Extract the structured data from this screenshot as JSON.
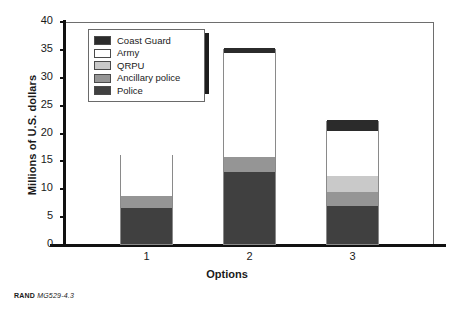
{
  "figure": {
    "footer_source": "RAND",
    "footer_number": "MG529-4.3"
  },
  "chart_data": {
    "type": "bar",
    "stacked": true,
    "title": "",
    "xlabel": "Options",
    "ylabel": "Millions of U.S. dollars",
    "categories": [
      "1",
      "2",
      "3"
    ],
    "ylim": [
      0,
      40
    ],
    "yticks": [
      0,
      5,
      10,
      15,
      20,
      25,
      30,
      35,
      40
    ],
    "ytick_labels": [
      "0",
      "5",
      "10",
      "15",
      "20",
      "25",
      "30",
      "35",
      "40"
    ],
    "grid": false,
    "legend_position": "upper-left-inside",
    "series": [
      {
        "name": "Police",
        "color": "#404040",
        "values": [
          6.5,
          13.0,
          6.8
        ]
      },
      {
        "name": "Ancillary police",
        "color": "#959595",
        "values": [
          2.2,
          2.6,
          2.6
        ]
      },
      {
        "name": "QRPU",
        "color": "#c9c9c9",
        "values": [
          0.0,
          0.0,
          2.8
        ]
      },
      {
        "name": "Army",
        "color": "#ffffff",
        "values": [
          7.4,
          18.6,
          8.1
        ]
      },
      {
        "name": "Coast Guard",
        "color": "#2b2b2b",
        "values": [
          0.0,
          1.0,
          2.0
        ]
      }
    ],
    "legend_order": [
      "Coast Guard",
      "Army",
      "QRPU",
      "Ancillary police",
      "Police"
    ],
    "totals": [
      16.1,
      35.2,
      22.3
    ]
  }
}
